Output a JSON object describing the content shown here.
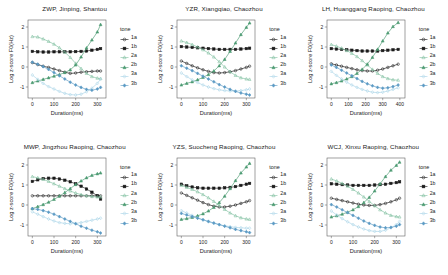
{
  "figure": {
    "panel_count": 6,
    "legend_title": "tone",
    "xlabel": "Duration(ms)",
    "ylabel": "Log z-score F0(Hz)",
    "colors": {
      "tone_1a": "#1a1a1a",
      "tone_1b": "#1a1a1a",
      "tone_2a": "#7fbf9f",
      "tone_2b": "#4c9b72",
      "tone_3a": "#a8d4e8",
      "tone_3b": "#5b9ac4"
    }
  },
  "legend": {
    "title": "tone",
    "entries": [
      {
        "label": "1a",
        "marker": "open-circle",
        "color": "#1a1a1a"
      },
      {
        "label": "1b",
        "marker": "filled-square",
        "color": "#1a1a1a"
      },
      {
        "label": "2a",
        "marker": "open-triangle",
        "color": "#7fbf9f"
      },
      {
        "label": "2b",
        "marker": "filled-triangle",
        "color": "#4c9b72"
      },
      {
        "label": "3a",
        "marker": "open-diamond",
        "color": "#a8d4e8"
      },
      {
        "label": "3b",
        "marker": "filled-diamond",
        "color": "#5b9ac4"
      }
    ]
  },
  "chart_data": [
    {
      "type": "line",
      "panel_index": 0,
      "title": "ZWP, Jinping, Shantou",
      "xlabel": "Duration(ms)",
      "ylabel": "Log z-score F0(Hz)",
      "xlim": [
        -20,
        340
      ],
      "ylim": [
        -1.55,
        2.35
      ],
      "xticks": [
        0,
        100,
        200,
        300
      ],
      "yticks": [
        -1,
        0,
        1,
        2
      ],
      "grid": false,
      "legend_position": "right",
      "x": [
        0,
        25,
        50,
        75,
        100,
        125,
        150,
        175,
        200,
        225,
        250,
        275,
        300,
        315
      ],
      "series": [
        {
          "name": "1a",
          "values": [
            0.22,
            0.12,
            0.04,
            -0.02,
            -0.1,
            -0.18,
            -0.26,
            -0.32,
            -0.3,
            -0.26,
            -0.24,
            -0.22,
            -0.2,
            -0.2
          ]
        },
        {
          "name": "1b",
          "values": [
            0.78,
            0.76,
            0.75,
            0.75,
            0.76,
            0.76,
            0.76,
            0.76,
            0.77,
            0.78,
            0.8,
            0.84,
            0.88,
            0.92
          ]
        },
        {
          "name": "2a",
          "values": [
            1.52,
            1.5,
            1.4,
            1.28,
            1.14,
            0.96,
            0.74,
            0.48,
            0.18,
            -0.08,
            -0.32,
            -0.48,
            -0.56,
            -0.58
          ]
        },
        {
          "name": "2b",
          "values": [
            -0.78,
            -0.7,
            -0.62,
            -0.54,
            -0.46,
            -0.38,
            -0.28,
            -0.14,
            0.1,
            0.5,
            0.95,
            1.35,
            1.75,
            2.12
          ]
        },
        {
          "name": "3a",
          "values": [
            -0.4,
            -0.62,
            -0.82,
            -0.98,
            -1.1,
            -1.22,
            -1.32,
            -1.38,
            -1.4,
            -1.36,
            -1.24,
            -1.06,
            -0.82,
            -0.6
          ]
        },
        {
          "name": "3b",
          "values": [
            0.24,
            0.14,
            0.02,
            -0.12,
            -0.28,
            -0.44,
            -0.6,
            -0.76,
            -0.9,
            -1.02,
            -1.12,
            -1.16,
            -1.1,
            -1.02
          ]
        }
      ]
    },
    {
      "type": "line",
      "panel_index": 1,
      "title": "YZR, Xiangqiao, Chaozhou",
      "xlabel": "Duration(ms)",
      "ylabel": "Log z-score F0(Hz)",
      "xlim": [
        -20,
        340
      ],
      "ylim": [
        -1.55,
        2.35
      ],
      "xticks": [
        0,
        100,
        200,
        300
      ],
      "yticks": [
        -1,
        0,
        1,
        2
      ],
      "grid": false,
      "legend_position": "right",
      "x": [
        0,
        25,
        50,
        75,
        100,
        125,
        150,
        175,
        200,
        225,
        250,
        275,
        300,
        315
      ],
      "series": [
        {
          "name": "1a",
          "values": [
            0.3,
            0.18,
            0.06,
            -0.04,
            -0.14,
            -0.22,
            -0.28,
            -0.3,
            -0.28,
            -0.24,
            -0.18,
            -0.1,
            -0.02,
            0.04
          ]
        },
        {
          "name": "1b",
          "values": [
            1.02,
            1.0,
            0.98,
            0.96,
            0.94,
            0.92,
            0.9,
            0.88,
            0.88,
            0.88,
            0.88,
            0.9,
            0.92,
            0.94
          ]
        },
        {
          "name": "2a",
          "values": [
            1.3,
            1.22,
            1.12,
            1.0,
            0.86,
            0.7,
            0.5,
            0.26,
            0.0,
            -0.24,
            -0.42,
            -0.54,
            -0.6,
            -0.62
          ]
        },
        {
          "name": "2b",
          "values": [
            -0.9,
            -0.82,
            -0.74,
            -0.64,
            -0.52,
            -0.38,
            -0.2,
            0.06,
            0.38,
            0.78,
            1.2,
            1.62,
            1.98,
            2.2
          ]
        },
        {
          "name": "3a",
          "values": [
            -0.3,
            -0.48,
            -0.64,
            -0.78,
            -0.9,
            -1.0,
            -1.08,
            -1.14,
            -1.18,
            -1.2,
            -1.2,
            -1.18,
            -1.14,
            -1.1
          ]
        },
        {
          "name": "3b",
          "values": [
            0.06,
            -0.06,
            -0.18,
            -0.32,
            -0.46,
            -0.6,
            -0.74,
            -0.88,
            -1.0,
            -1.12,
            -1.22,
            -1.3,
            -1.36,
            -1.4
          ]
        }
      ]
    },
    {
      "type": "line",
      "panel_index": 2,
      "title": "LH, Huanggang Raoping, Chaozhou",
      "xlabel": "Duration(ms)",
      "ylabel": "Log z-score F0(Hz)",
      "xlim": [
        -25,
        430
      ],
      "ylim": [
        -1.55,
        2.35
      ],
      "xticks": [
        0,
        100,
        200,
        300,
        400
      ],
      "yticks": [
        -1,
        0,
        1,
        2
      ],
      "grid": false,
      "legend_position": "right",
      "x": [
        0,
        30,
        60,
        90,
        120,
        150,
        180,
        210,
        240,
        270,
        300,
        330,
        360,
        390
      ],
      "series": [
        {
          "name": "1a",
          "values": [
            0.16,
            0.1,
            0.04,
            -0.02,
            -0.08,
            -0.14,
            -0.18,
            -0.2,
            -0.2,
            -0.16,
            -0.1,
            -0.02,
            0.06,
            0.14
          ]
        },
        {
          "name": "1b",
          "values": [
            0.92,
            0.9,
            0.88,
            0.86,
            0.84,
            0.82,
            0.8,
            0.8,
            0.8,
            0.8,
            0.82,
            0.84,
            0.86,
            0.88
          ]
        },
        {
          "name": "2a",
          "values": [
            1.12,
            1.04,
            0.94,
            0.82,
            0.68,
            0.52,
            0.32,
            0.1,
            -0.12,
            -0.32,
            -0.48,
            -0.58,
            -0.64,
            -0.66
          ]
        },
        {
          "name": "2b",
          "values": [
            -0.84,
            -0.78,
            -0.7,
            -0.6,
            -0.48,
            -0.32,
            -0.12,
            0.14,
            0.48,
            0.88,
            1.3,
            1.7,
            2.02,
            2.22
          ]
        },
        {
          "name": "3a",
          "values": [
            -0.22,
            -0.42,
            -0.6,
            -0.76,
            -0.9,
            -1.02,
            -1.12,
            -1.2,
            -1.26,
            -1.28,
            -1.26,
            -1.2,
            -1.12,
            -1.04
          ]
        },
        {
          "name": "3b",
          "values": [
            0.1,
            -0.02,
            -0.16,
            -0.3,
            -0.44,
            -0.58,
            -0.72,
            -0.84,
            -0.94,
            -1.02,
            -1.06,
            -1.04,
            -0.98,
            -0.9
          ]
        }
      ]
    },
    {
      "type": "line",
      "panel_index": 3,
      "title": "MWP, Jingzhou Raoping, Chaozhou",
      "xlabel": "Duration(ms)",
      "ylabel": "Log z-score F0(Hz)",
      "xlim": [
        -20,
        340
      ],
      "ylim": [
        -1.55,
        2.35
      ],
      "xticks": [
        0,
        100,
        200,
        300
      ],
      "yticks": [
        -1,
        0,
        1,
        2
      ],
      "grid": false,
      "legend_position": "right",
      "x": [
        0,
        25,
        50,
        75,
        100,
        125,
        150,
        175,
        200,
        225,
        250,
        275,
        300,
        315
      ],
      "series": [
        {
          "name": "1a",
          "values": [
            0.46,
            0.46,
            0.46,
            0.46,
            0.46,
            0.46,
            0.46,
            0.46,
            0.46,
            0.46,
            0.46,
            0.46,
            0.46,
            0.46
          ]
        },
        {
          "name": "1b",
          "values": [
            1.18,
            1.26,
            1.32,
            1.34,
            1.34,
            1.3,
            1.24,
            1.16,
            1.06,
            0.94,
            0.8,
            0.64,
            0.46,
            0.3
          ]
        },
        {
          "name": "2a",
          "values": [
            1.42,
            1.36,
            1.28,
            1.18,
            1.06,
            0.94,
            0.82,
            0.7,
            0.6,
            0.52,
            0.46,
            0.42,
            0.4,
            0.4
          ]
        },
        {
          "name": "2b",
          "values": [
            -0.18,
            -0.08,
            0.02,
            0.14,
            0.28,
            0.44,
            0.62,
            0.82,
            1.02,
            1.2,
            1.36,
            1.48,
            1.56,
            1.6
          ]
        },
        {
          "name": "3a",
          "values": [
            -0.34,
            -0.46,
            -0.58,
            -0.7,
            -0.8,
            -0.88,
            -0.92,
            -0.94,
            -0.92,
            -0.88,
            -0.82,
            -0.76,
            -0.7,
            -0.66
          ]
        },
        {
          "name": "3b",
          "values": [
            -0.18,
            -0.22,
            -0.28,
            -0.36,
            -0.46,
            -0.58,
            -0.7,
            -0.82,
            -0.94,
            -1.06,
            -1.16,
            -1.26,
            -1.34,
            -1.4
          ]
        }
      ]
    },
    {
      "type": "line",
      "panel_index": 4,
      "title": "YZS, Suocheng Raoping, Chaozhou",
      "xlabel": "Duration(ms)",
      "ylabel": "Log z-score F0(Hz)",
      "xlim": [
        -20,
        340
      ],
      "ylim": [
        -1.55,
        2.35
      ],
      "xticks": [
        0,
        100,
        200,
        300
      ],
      "yticks": [
        -1,
        0,
        1,
        2
      ],
      "grid": false,
      "legend_position": "right",
      "x": [
        0,
        25,
        50,
        75,
        100,
        125,
        150,
        175,
        200,
        225,
        250,
        275,
        300,
        315
      ],
      "series": [
        {
          "name": "1a",
          "values": [
            0.6,
            0.48,
            0.36,
            0.24,
            0.12,
            0.02,
            -0.06,
            -0.1,
            -0.1,
            -0.06,
            0.0,
            0.08,
            0.16,
            0.22
          ]
        },
        {
          "name": "1b",
          "values": [
            1.04,
            0.96,
            0.9,
            0.86,
            0.84,
            0.84,
            0.84,
            0.84,
            0.86,
            0.88,
            0.92,
            0.98,
            1.04,
            1.08
          ]
        },
        {
          "name": "2a",
          "values": [
            0.98,
            0.88,
            0.78,
            0.66,
            0.52,
            0.36,
            0.18,
            -0.02,
            -0.22,
            -0.4,
            -0.54,
            -0.64,
            -0.7,
            -0.72
          ]
        },
        {
          "name": "2b",
          "values": [
            -0.72,
            -0.68,
            -0.62,
            -0.54,
            -0.44,
            -0.3,
            -0.12,
            0.12,
            0.44,
            0.82,
            1.22,
            1.6,
            1.9,
            2.08
          ]
        },
        {
          "name": "3a",
          "values": [
            -0.28,
            -0.4,
            -0.52,
            -0.64,
            -0.74,
            -0.84,
            -0.92,
            -0.98,
            -1.04,
            -1.08,
            -1.12,
            -1.14,
            -1.16,
            -1.16
          ]
        },
        {
          "name": "3b",
          "values": [
            -0.42,
            -0.5,
            -0.58,
            -0.66,
            -0.74,
            -0.82,
            -0.9,
            -0.98,
            -1.06,
            -1.14,
            -1.22,
            -1.28,
            -1.34,
            -1.38
          ]
        }
      ]
    },
    {
      "type": "line",
      "panel_index": 5,
      "title": "WCJ, Xinxu Raoping, Chaozhou",
      "xlabel": "Duration(ms)",
      "ylabel": "Log z-score F0(Hz)",
      "xlim": [
        -20,
        340
      ],
      "ylim": [
        -1.55,
        2.35
      ],
      "xticks": [
        0,
        100,
        200,
        300
      ],
      "yticks": [
        -1,
        0,
        1,
        2
      ],
      "grid": false,
      "legend_position": "right",
      "x": [
        0,
        25,
        50,
        75,
        100,
        125,
        150,
        175,
        200,
        225,
        250,
        275,
        300,
        315
      ],
      "series": [
        {
          "name": "1a",
          "values": [
            0.34,
            0.28,
            0.22,
            0.16,
            0.1,
            0.04,
            0.0,
            -0.02,
            -0.02,
            0.02,
            0.08,
            0.16,
            0.26,
            0.34
          ]
        },
        {
          "name": "1b",
          "values": [
            1.06,
            1.04,
            1.02,
            1.0,
            0.98,
            0.98,
            0.98,
            0.98,
            1.0,
            1.02,
            1.04,
            1.08,
            1.12,
            1.16
          ]
        },
        {
          "name": "2a",
          "values": [
            1.3,
            1.2,
            1.08,
            0.94,
            0.78,
            0.6,
            0.4,
            0.18,
            -0.04,
            -0.24,
            -0.4,
            -0.52,
            -0.58,
            -0.6
          ]
        },
        {
          "name": "2b",
          "values": [
            -0.6,
            -0.54,
            -0.46,
            -0.36,
            -0.24,
            -0.08,
            0.12,
            0.38,
            0.7,
            1.06,
            1.42,
            1.74,
            1.98,
            2.14
          ]
        },
        {
          "name": "3a",
          "values": [
            -0.3,
            -0.5,
            -0.68,
            -0.84,
            -0.98,
            -1.1,
            -1.2,
            -1.28,
            -1.32,
            -1.32,
            -1.26,
            -1.14,
            -0.98,
            -0.82
          ]
        },
        {
          "name": "3b",
          "values": [
            0.02,
            -0.1,
            -0.24,
            -0.38,
            -0.52,
            -0.66,
            -0.8,
            -0.92,
            -1.02,
            -1.1,
            -1.14,
            -1.12,
            -1.06,
            -0.98
          ]
        }
      ]
    }
  ]
}
